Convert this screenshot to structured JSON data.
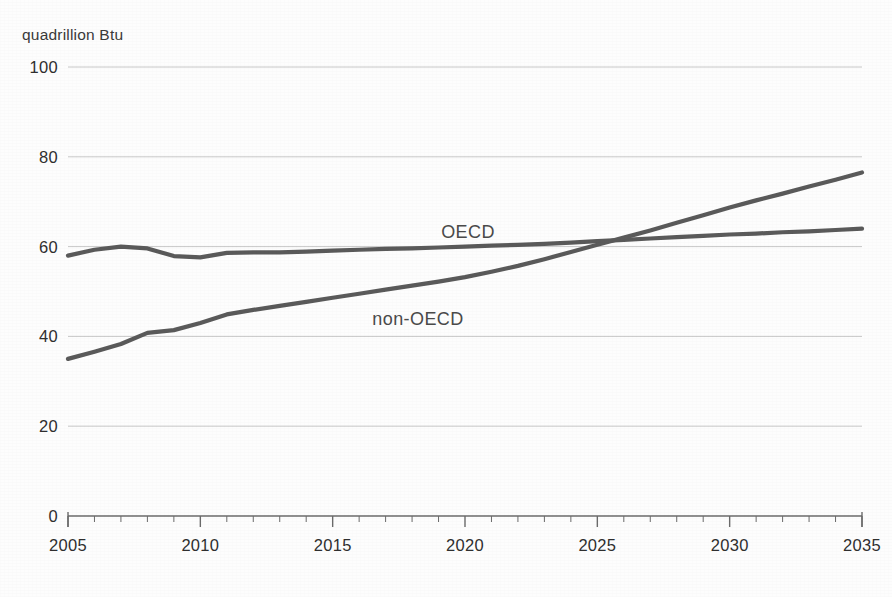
{
  "chart_data": {
    "type": "line",
    "title": "",
    "subtitle": "",
    "xlabel": "",
    "ylabel": "quadrillion Btu",
    "ylim": [
      0,
      100
    ],
    "xlim": [
      2005,
      2035
    ],
    "y_ticks": [
      0,
      20,
      40,
      60,
      80,
      100
    ],
    "y_tick_labels": [
      "0",
      "20",
      "40",
      "60",
      "80",
      "100"
    ],
    "x_ticks": [
      2005,
      2010,
      2015,
      2020,
      2025,
      2030,
      2035
    ],
    "x_tick_labels": [
      "2005",
      "2010",
      "2015",
      "2020",
      "2025",
      "2030",
      "2035"
    ],
    "x_minor_tick_interval": 1,
    "grid": "horizontal",
    "legend_position": "inline-labels",
    "line_color": "#5a5a5a",
    "grid_color": "#c8c8c8",
    "axis_color": "#6b6b6b",
    "text_color": "#2f2f2f",
    "x": [
      2005,
      2006,
      2007,
      2008,
      2009,
      2010,
      2011,
      2012,
      2013,
      2014,
      2015,
      2016,
      2017,
      2018,
      2019,
      2020,
      2021,
      2022,
      2023,
      2024,
      2025,
      2026,
      2027,
      2028,
      2029,
      2030,
      2031,
      2032,
      2033,
      2034,
      2035
    ],
    "series": [
      {
        "name": "OECD",
        "label": "OECD",
        "label_x": 2019.1,
        "label_y": 65.5,
        "color": "#5a5a5a",
        "values": [
          58.0,
          59.3,
          60.0,
          59.6,
          57.9,
          57.6,
          58.6,
          58.7,
          58.7,
          58.9,
          59.1,
          59.3,
          59.5,
          59.6,
          59.8,
          60.0,
          60.2,
          60.4,
          60.6,
          60.9,
          61.2,
          61.5,
          61.8,
          62.1,
          62.4,
          62.7,
          62.9,
          63.2,
          63.4,
          63.7,
          64.0
        ]
      },
      {
        "name": "non-OECD",
        "label": "non-OECD",
        "label_x": 2016.5,
        "label_y": 46.0,
        "color": "#5a5a5a",
        "values": [
          35.0,
          36.6,
          38.3,
          40.8,
          41.4,
          43.0,
          44.9,
          45.9,
          46.8,
          47.7,
          48.6,
          49.5,
          50.4,
          51.3,
          52.2,
          53.2,
          54.4,
          55.7,
          57.2,
          58.8,
          60.4,
          62.0,
          63.6,
          65.3,
          67.0,
          68.7,
          70.3,
          71.8,
          73.4,
          74.9,
          76.5
        ]
      }
    ]
  }
}
